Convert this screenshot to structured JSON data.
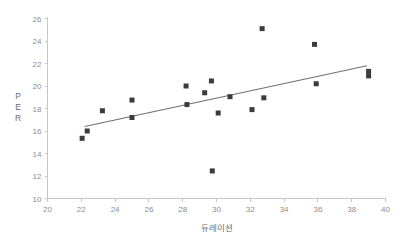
{
  "chart_data": {
    "type": "scatter",
    "title": "",
    "xlabel": "듀레이션",
    "ylabel": "PER",
    "xlim": [
      20,
      40
    ],
    "ylim": [
      10,
      26
    ],
    "xticks": [
      20,
      22,
      24,
      26,
      28,
      30,
      32,
      34,
      36,
      38,
      40
    ],
    "yticks": [
      10,
      12,
      14,
      16,
      18,
      20,
      22,
      24,
      26
    ],
    "grid": false,
    "legend": null,
    "points": [
      {
        "x": 22.05,
        "y": 15.35
      },
      {
        "x": 22.35,
        "y": 16.0
      },
      {
        "x": 23.25,
        "y": 17.8
      },
      {
        "x": 25.0,
        "y": 18.75
      },
      {
        "x": 25.0,
        "y": 17.2
      },
      {
        "x": 28.2,
        "y": 20.0
      },
      {
        "x": 28.25,
        "y": 18.35
      },
      {
        "x": 29.3,
        "y": 19.4
      },
      {
        "x": 29.7,
        "y": 20.45
      },
      {
        "x": 29.75,
        "y": 12.45
      },
      {
        "x": 30.1,
        "y": 17.6
      },
      {
        "x": 30.8,
        "y": 19.05
      },
      {
        "x": 32.1,
        "y": 17.9
      },
      {
        "x": 32.7,
        "y": 25.1
      },
      {
        "x": 32.8,
        "y": 18.95
      },
      {
        "x": 35.8,
        "y": 23.7
      },
      {
        "x": 35.9,
        "y": 20.2
      },
      {
        "x": 39.0,
        "y": 21.3
      },
      {
        "x": 39.0,
        "y": 20.9
      }
    ],
    "trend_line": {
      "x_start": 22.2,
      "y_start": 16.4,
      "x_end": 38.9,
      "y_end": 21.8
    },
    "ylabel_letters": [
      "P",
      "E",
      "R"
    ]
  },
  "colors": {
    "marker": "#3b3b3b",
    "trend_line": "#6b6b6b",
    "axis": "#c7c7c7",
    "tick_label": "#8d8d8d",
    "axis_title": "#6e6e6e",
    "background": "#ffffff"
  }
}
